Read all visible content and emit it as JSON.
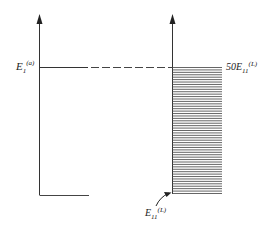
{
  "diagram": {
    "type": "energy-level comparison",
    "left_label": {
      "base": "E",
      "sub": "1",
      "sup": "(a)"
    },
    "right_top_label": {
      "coef": "50",
      "base": "E",
      "sub": "11",
      "sup": "(L)"
    },
    "right_bottom_label": {
      "base": "E",
      "sub": "11",
      "sup": "(L)"
    },
    "hatch_line_count": 53,
    "colors": {
      "line": "#333333",
      "hatch": "#555555"
    }
  }
}
